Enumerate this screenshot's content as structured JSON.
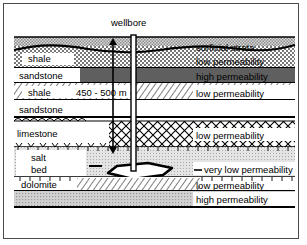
{
  "diagram": {
    "title_annotation": "wellbore",
    "depth_annotation": "450 - 500 m",
    "cavern_name": "salt cavern",
    "colors": {
      "surficial_fill": "#b9b9b9",
      "shale_fill": "#ffffff",
      "sandstone_dark_fill": "#6e6e6e",
      "sandstone_light_fill": "#ffffff",
      "limestone_fill": "#ffffff",
      "salt_fill": "#d8d8d8",
      "dolomite_fill": "#ffffff",
      "aquifer_fill": "#c9c9c9",
      "line": "#000000",
      "frame": "#4a4a4a"
    },
    "layers": [
      {
        "id": "surficial",
        "left_label": "",
        "right_label": "surficial strata",
        "pattern": "stipple-gray"
      },
      {
        "id": "shale-upper",
        "left_label": "shale",
        "right_label": "low permeability",
        "pattern": "checker"
      },
      {
        "id": "sandstone-upper",
        "left_label": "sandstone",
        "right_label": "high permeability",
        "pattern": "solid-dark"
      },
      {
        "id": "shale-lower",
        "left_label": "shale",
        "right_label": "low permeability",
        "pattern": "diagonal-hatch"
      },
      {
        "id": "sandstone-lower",
        "left_label": "sandstone",
        "right_label": "",
        "pattern": "blank"
      },
      {
        "id": "limestone",
        "left_label": "limestone",
        "right_label": "low permeability",
        "pattern": "diamond-lattice"
      },
      {
        "id": "salt-bed",
        "left_label": "salt",
        "right_label": "very low permeability",
        "pattern": "light-stipple"
      },
      {
        "id": "salt-bed-2",
        "left_label": "bed",
        "right_label": "",
        "pattern": "light-stipple"
      },
      {
        "id": "dolomite",
        "left_label": "dolomite",
        "right_label": "low permeability",
        "pattern": "diagonal-hatch"
      },
      {
        "id": "aquifer",
        "left_label": "",
        "right_label": "high permeability",
        "pattern": "stipple-gray"
      }
    ]
  }
}
